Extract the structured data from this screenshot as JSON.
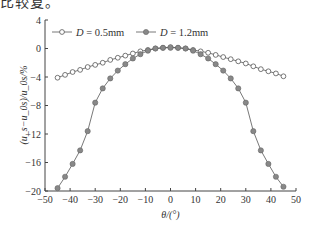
{
  "header_fragment": "比较复。",
  "chart_data": {
    "type": "line",
    "title": "",
    "xlabel": "θ/(°)",
    "ylabel": "(u_s−u_0s)/u_0s/%",
    "xlim": [
      -50,
      50
    ],
    "ylim": [
      -20,
      4
    ],
    "xticks": [
      -50,
      -40,
      -30,
      -20,
      -10,
      0,
      10,
      20,
      30,
      40,
      50
    ],
    "yticks": [
      4,
      0,
      -4,
      -8,
      -12,
      -16,
      -20
    ],
    "grid": false,
    "legend_position": "top-left",
    "series": [
      {
        "name": "D = 0.5mm",
        "marker": "open-circle",
        "color": "#555555",
        "x": [
          -45,
          -42,
          -39,
          -36,
          -33,
          -30,
          -27,
          -24,
          -21,
          -18,
          -15,
          -12,
          -9,
          -6,
          -3,
          0,
          3,
          6,
          9,
          12,
          15,
          18,
          21,
          24,
          27,
          30,
          33,
          36,
          39,
          42,
          45
        ],
        "values": [
          -4.1,
          -3.7,
          -3.3,
          -3.0,
          -2.6,
          -2.3,
          -2.0,
          -1.6,
          -1.3,
          -1.0,
          -0.7,
          -0.4,
          -0.2,
          0.0,
          0.1,
          0.2,
          0.1,
          0.0,
          -0.2,
          -0.4,
          -0.6,
          -0.9,
          -1.2,
          -1.5,
          -1.8,
          -2.1,
          -2.5,
          -2.9,
          -3.2,
          -3.5,
          -3.9
        ]
      },
      {
        "name": "D = 1.2mm",
        "marker": "filled-circle",
        "color": "#888888",
        "x": [
          -45,
          -42,
          -39,
          -36,
          -33,
          -30,
          -27,
          -24,
          -21,
          -18,
          -15,
          -12,
          -9,
          -6,
          -3,
          0,
          3,
          6,
          9,
          12,
          15,
          18,
          21,
          24,
          27,
          30,
          33,
          36,
          39,
          42,
          45
        ],
        "values": [
          -19.6,
          -18.0,
          -16.2,
          -14.3,
          -11.6,
          -7.6,
          -5.6,
          -4.2,
          -3.1,
          -2.2,
          -1.4,
          -0.8,
          -0.3,
          0.0,
          0.1,
          0.1,
          0.1,
          0.0,
          -0.3,
          -0.8,
          -1.4,
          -2.2,
          -3.1,
          -4.2,
          -5.6,
          -7.6,
          -11.6,
          -14.3,
          -16.2,
          -18.0,
          -19.4
        ]
      }
    ]
  }
}
